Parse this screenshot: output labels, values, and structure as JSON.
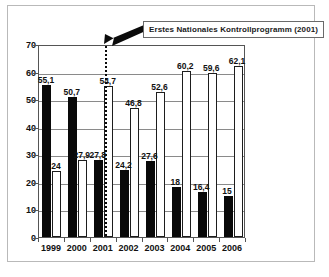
{
  "figure": {
    "annotation": {
      "text": "Erstes Nationales Kontrollprogramm (2001)",
      "marker_year": "2001"
    }
  },
  "chart_data": {
    "type": "bar",
    "title": "",
    "subtitle": "",
    "xlabel": "",
    "ylabel": "",
    "categories": [
      "1999",
      "2000",
      "2001",
      "2002",
      "2003",
      "2004",
      "2005",
      "2006"
    ],
    "series": [
      {
        "name": "dark",
        "color": "#000000",
        "values": [
          55.1,
          50.7,
          27.8,
          24.2,
          27.6,
          18,
          16.4,
          15
        ],
        "labels": [
          "55,1",
          "50,7",
          "27,8",
          "24,2",
          "27,6",
          "18",
          "16,4",
          "15"
        ]
      },
      {
        "name": "light",
        "color": "#ffffff",
        "values": [
          24,
          27.9,
          54.7,
          46.8,
          52.6,
          60.2,
          59.6,
          62.1
        ],
        "labels": [
          "24",
          "27,9",
          "54,7",
          "46,8",
          "52,6",
          "60,2",
          "59,6",
          "62,1"
        ]
      }
    ],
    "ylim": [
      0,
      70
    ],
    "yticks": [
      0,
      10,
      20,
      30,
      40,
      50,
      60,
      70
    ],
    "ytick_labels": [
      "0",
      "10",
      "20",
      "30",
      "40",
      "50",
      "60",
      "70"
    ],
    "grid": true,
    "legend": false,
    "annotations": [
      {
        "text": "Erstes Nationales Kontrollprogramm (2001)",
        "points_to": "2001",
        "style": "boxed-arrow"
      }
    ]
  }
}
